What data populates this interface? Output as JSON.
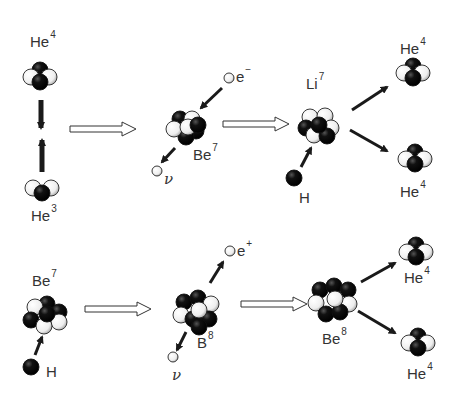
{
  "colors": {
    "neutron": "#111111",
    "proton": "#f4f4f4",
    "outline": "#222222",
    "arrow": "#1a1a1a"
  },
  "row1": {
    "he4_reactant": {
      "symbol": "He",
      "mass": "4"
    },
    "he3_reactant": {
      "symbol": "He",
      "mass": "3"
    },
    "be7": {
      "symbol": "Be",
      "mass": "7"
    },
    "electron": {
      "symbol": "e",
      "charge": "−"
    },
    "neutrino": {
      "symbol": "ν"
    },
    "li7": {
      "symbol": "Li",
      "mass": "7"
    },
    "hydrogen": {
      "symbol": "H"
    },
    "he4_top": {
      "symbol": "He",
      "mass": "4"
    },
    "he4_bottom": {
      "symbol": "He",
      "mass": "4"
    }
  },
  "row2": {
    "be7": {
      "symbol": "Be",
      "mass": "7"
    },
    "hydrogen": {
      "symbol": "H"
    },
    "b8": {
      "symbol": "B",
      "mass": "8"
    },
    "positron": {
      "symbol": "e",
      "charge": "+"
    },
    "neutrino": {
      "symbol": "ν"
    },
    "be8": {
      "symbol": "Be",
      "mass": "8"
    },
    "he4_top": {
      "symbol": "He",
      "mass": "4"
    },
    "he4_bottom": {
      "symbol": "He",
      "mass": "4"
    }
  }
}
